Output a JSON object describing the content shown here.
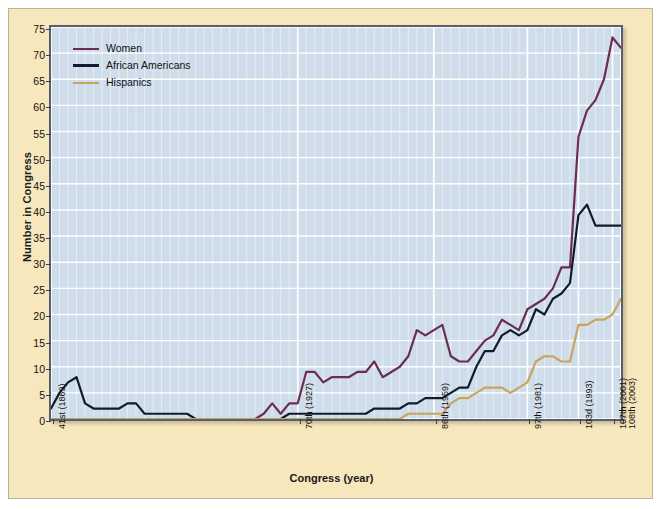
{
  "chart_data": {
    "type": "line",
    "title": "",
    "xlabel": "Congress (year)",
    "ylabel": "Number in Congress",
    "ylim": [
      0,
      75
    ],
    "ytick_step": 5,
    "yticks": [
      0,
      5,
      10,
      15,
      20,
      25,
      30,
      35,
      40,
      45,
      50,
      55,
      60,
      65,
      70,
      75
    ],
    "grid": true,
    "legend_position": "top-left",
    "xtick_labels": [
      "41st (1869)",
      "70th (1927)",
      "86th (1959)",
      "97th (1981)",
      "103d (1993)",
      "107th (2001)",
      "108th (2003)"
    ],
    "xtick_congress_numbers": [
      41,
      70,
      86,
      97,
      103,
      107,
      108
    ],
    "x_range_congress": [
      41,
      108
    ],
    "congresses": [
      41,
      42,
      43,
      44,
      45,
      46,
      47,
      48,
      49,
      50,
      51,
      52,
      53,
      54,
      55,
      56,
      57,
      58,
      59,
      60,
      61,
      62,
      63,
      64,
      65,
      66,
      67,
      68,
      69,
      70,
      71,
      72,
      73,
      74,
      75,
      76,
      77,
      78,
      79,
      80,
      81,
      82,
      83,
      84,
      85,
      86,
      87,
      88,
      89,
      90,
      91,
      92,
      93,
      94,
      95,
      96,
      97,
      98,
      99,
      100,
      101,
      102,
      103,
      104,
      105,
      106,
      107,
      108
    ],
    "series": [
      {
        "name": "Women",
        "color": "#6b2e4e",
        "values": [
          0,
          0,
          0,
          0,
          0,
          0,
          0,
          0,
          0,
          0,
          0,
          0,
          0,
          0,
          0,
          0,
          0,
          0,
          0,
          0,
          0,
          0,
          0,
          0,
          0,
          1,
          3,
          1,
          3,
          3,
          9,
          9,
          7,
          8,
          8,
          8,
          9,
          9,
          11,
          8,
          9,
          10,
          12,
          17,
          16,
          17,
          18,
          12,
          11,
          11,
          13,
          15,
          16,
          19,
          18,
          17,
          21,
          22,
          23,
          25,
          29,
          29,
          54,
          59,
          61,
          65,
          73,
          71
        ]
      },
      {
        "name": "African Americans",
        "color": "#101c2b",
        "values": [
          2,
          5,
          7,
          8,
          3,
          2,
          2,
          2,
          2,
          3,
          3,
          1,
          1,
          1,
          1,
          1,
          1,
          0,
          0,
          0,
          0,
          0,
          0,
          0,
          0,
          0,
          0,
          0,
          1,
          1,
          1,
          1,
          1,
          1,
          1,
          1,
          1,
          1,
          2,
          2,
          2,
          2,
          3,
          3,
          4,
          4,
          4,
          5,
          6,
          6,
          10,
          13,
          13,
          16,
          17,
          16,
          17,
          21,
          20,
          23,
          24,
          26,
          39,
          41,
          37,
          37,
          37,
          37
        ]
      },
      {
        "name": "Hispanics",
        "color": "#c9a55c",
        "values": [
          0,
          0,
          0,
          0,
          0,
          0,
          0,
          0,
          0,
          0,
          0,
          0,
          0,
          0,
          0,
          0,
          0,
          0,
          0,
          0,
          0,
          0,
          0,
          0,
          0,
          0,
          0,
          0,
          0,
          0,
          0,
          0,
          0,
          0,
          0,
          0,
          0,
          0,
          0,
          0,
          0,
          0,
          1,
          1,
          1,
          1,
          1,
          3,
          4,
          4,
          5,
          6,
          6,
          6,
          5,
          6,
          7,
          11,
          12,
          12,
          11,
          11,
          18,
          18,
          19,
          19,
          20,
          23
        ]
      }
    ]
  },
  "legend": {
    "items": [
      {
        "label": "Women",
        "color": "#6b2e4e"
      },
      {
        "label": "African Americans",
        "color": "#101c2b"
      },
      {
        "label": "Hispanics",
        "color": "#c9a55c"
      }
    ]
  },
  "axes": {
    "y_title": "Number in Congress",
    "x_title": "Congress (year)"
  }
}
